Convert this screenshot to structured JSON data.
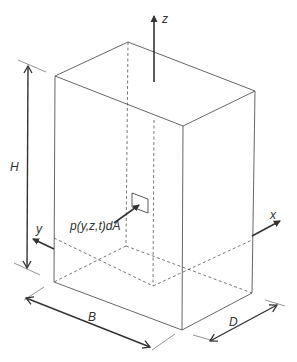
{
  "figure": {
    "type": "3d-box-schematic",
    "axes": {
      "z": "z",
      "y": "y",
      "x": "x"
    },
    "dimensions": {
      "height": "H",
      "width": "B",
      "depth": "D"
    },
    "element_label": "p(y,z,t)dA",
    "colors": {
      "line": "#555555",
      "arrow": "#333333",
      "background": "#ffffff"
    }
  }
}
